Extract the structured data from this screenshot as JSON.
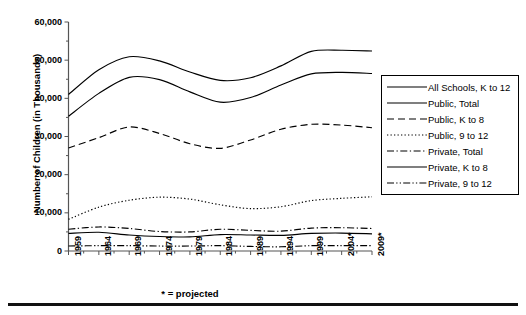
{
  "chart_data": {
    "type": "line",
    "title": "",
    "xlabel": "",
    "ylabel": "Number of Children (in Thousands)",
    "footnote": "* = projected",
    "grid": false,
    "legend_position": "right",
    "ylim": [
      0,
      60000
    ],
    "yticks": [
      "0",
      "10,000",
      "20,000",
      "30,000",
      "40,000",
      "50,000",
      "60,000"
    ],
    "ytick_values": [
      0,
      10000,
      20000,
      30000,
      40000,
      50000,
      60000
    ],
    "x": [
      1959,
      1964,
      1969,
      1974,
      1979,
      1984,
      1989,
      1994,
      1999,
      2004,
      2009
    ],
    "categories": [
      "1959",
      "1964",
      "1969",
      "1974",
      "1979",
      "1984",
      "1989",
      "1994",
      "1999",
      "2004*",
      "2009*"
    ],
    "series": [
      {
        "name": "All Schools, K to 12",
        "style": "solid",
        "values": [
          41000,
          47500,
          50900,
          49800,
          46900,
          44700,
          45400,
          48500,
          52300,
          52600,
          52400
        ]
      },
      {
        "name": "Public, Total",
        "style": "dashed-long",
        "values": [
          35300,
          41300,
          45500,
          44900,
          41700,
          39000,
          40200,
          43500,
          46400,
          46800,
          46500
        ]
      },
      {
        "name": "Public, K to 8",
        "style": "dashed",
        "values": [
          27000,
          29700,
          32500,
          30800,
          28100,
          26900,
          29100,
          31900,
          33200,
          33000,
          32300
        ]
      },
      {
        "name": "Public, 9 to 12",
        "style": "dotted",
        "values": [
          8300,
          11500,
          13300,
          14100,
          13600,
          12100,
          11100,
          11600,
          13200,
          13800,
          14200
        ]
      },
      {
        "name": "Private, Total",
        "style": "dashdot",
        "values": [
          5700,
          6300,
          5900,
          5100,
          5000,
          5700,
          5400,
          5200,
          6000,
          6100,
          5900
        ]
      },
      {
        "name": "Private, K to 8",
        "style": "solid",
        "values": [
          4600,
          4900,
          4200,
          3800,
          3700,
          4300,
          4200,
          4100,
          4600,
          4700,
          4500
        ]
      },
      {
        "name": "Private, 9 to 12",
        "style": "dashdotdot",
        "values": [
          1300,
          1400,
          1400,
          1300,
          1300,
          1400,
          1200,
          1100,
          1400,
          1400,
          1400
        ]
      }
    ]
  },
  "legend": {
    "items": [
      {
        "label": "All Schools, K to 12",
        "style": "solid"
      },
      {
        "label": "Public, Total",
        "style": "solid"
      },
      {
        "label": "Public, K to 8",
        "style": "dashed"
      },
      {
        "label": "Public, 9 to 12",
        "style": "dotted"
      },
      {
        "label": "Private, Total",
        "style": "dashdot"
      },
      {
        "label": "Private, K to 8",
        "style": "solid"
      },
      {
        "label": "Private, 9 to 12",
        "style": "dashdotdot"
      }
    ]
  },
  "colors": {
    "line": "#000000",
    "axis": "#555555",
    "background": "#ffffff"
  }
}
